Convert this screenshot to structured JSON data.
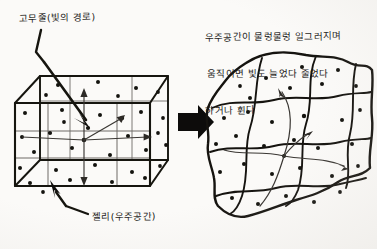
{
  "diagram": {
    "title_text_present": false,
    "background_color": "#fbfaf8",
    "ink_color": "#1c1a18",
    "grid_color": "#6e6b66"
  },
  "left_panel": {
    "name": "rigid-space-cube",
    "label_rubberband": "고무줄(빛의 경로)",
    "label_jelly": "젤리(우주공간)",
    "shape": "cube",
    "description_visible": false,
    "star_dot_count": 34,
    "arrow_count": 4
  },
  "transform_arrow": {
    "name": "block-arrow",
    "direction": "right",
    "color": "#0d0c0b"
  },
  "right_panel": {
    "name": "warped-space-blob",
    "caption_lines": [
      "우주공간이 물렁물렁 일그러지며",
      "움직이면 빛도 늘었다 줄었다",
      "하거나 휜다"
    ],
    "shape": "warped-blob",
    "star_dot_count": 32,
    "arrow_count": 3
  }
}
